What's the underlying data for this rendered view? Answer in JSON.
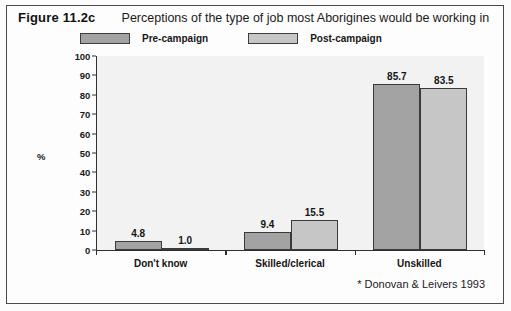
{
  "figure": {
    "number": "Figure 11.2c",
    "caption": "Perceptions of the type of job most Aborigines would be working in",
    "footnote": "* Donovan & Leivers 1993"
  },
  "legend": {
    "position": "top",
    "items": [
      {
        "label": "Pre-campaign",
        "color": "#a3a3a3"
      },
      {
        "label": "Post-campaign",
        "color": "#c6c6c6"
      }
    ]
  },
  "chart_data": {
    "type": "bar",
    "title": "Perceptions of the type of job most Aborigines would be working in",
    "xlabel": "",
    "ylabel": "%",
    "ylim": [
      0,
      100
    ],
    "ytick_step": 10,
    "yticks": [
      "0",
      "10",
      "20",
      "30",
      "40",
      "50",
      "60",
      "70",
      "80",
      "90",
      "100"
    ],
    "grid": false,
    "categories": [
      "Don't know",
      "Skilled/clerical",
      "Unskilled"
    ],
    "series": [
      {
        "name": "Pre-campaign",
        "color": "#a3a3a3",
        "values": [
          4.8,
          1.0,
          85.7
        ],
        "labels": [
          "4.8",
          "9.4",
          "85.7"
        ]
      },
      {
        "name": "Post-campaign",
        "color": "#c6c6c6",
        "values": [
          1.0,
          15.5,
          83.5
        ],
        "labels": [
          "1.0",
          "15.5",
          "83.5"
        ]
      }
    ],
    "groups": [
      {
        "category": "Don't know",
        "bars": [
          {
            "series": "Pre-campaign",
            "value": 4.8,
            "label": "4.8",
            "color": "#a3a3a3"
          },
          {
            "series": "Post-campaign",
            "value": 1.0,
            "label": "1.0",
            "color": "#c6c6c6"
          }
        ]
      },
      {
        "category": "Skilled/clerical",
        "bars": [
          {
            "series": "Pre-campaign",
            "value": 9.4,
            "label": "9.4",
            "color": "#a3a3a3"
          },
          {
            "series": "Post-campaign",
            "value": 15.5,
            "label": "15.5",
            "color": "#c6c6c6"
          }
        ]
      },
      {
        "category": "Unskilled",
        "bars": [
          {
            "series": "Pre-campaign",
            "value": 85.7,
            "label": "85.7",
            "color": "#a3a3a3"
          },
          {
            "series": "Post-campaign",
            "value": 83.5,
            "label": "83.5",
            "color": "#c6c6c6"
          }
        ]
      }
    ]
  },
  "colors": {
    "frame": "#4a4a4a",
    "axis": "#2f2f2f",
    "plot_background": "#f2f2f2",
    "page_background": "#fdfdfd",
    "text": "#151515"
  }
}
